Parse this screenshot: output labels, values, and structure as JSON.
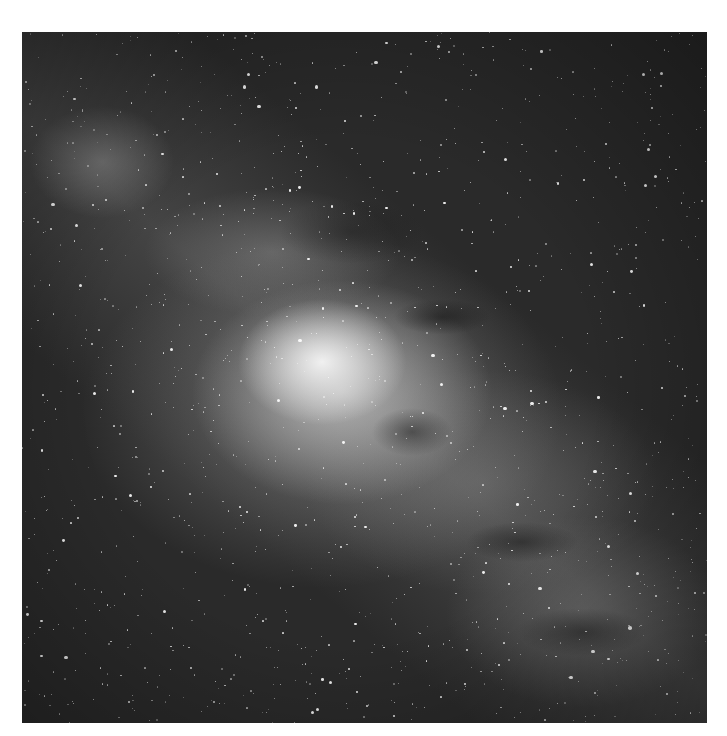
{
  "image": {
    "subject": "Milky Way galactic center star field",
    "tone": "grayscale",
    "colors": {
      "background": "#ffffff",
      "sky": "#2a2a2a",
      "core": "#f0f0f0"
    }
  }
}
